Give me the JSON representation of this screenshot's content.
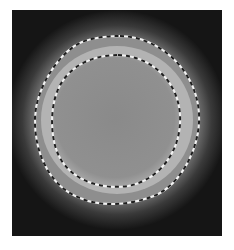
{
  "image": {
    "description": "Grayscale scan showing a bright roughly circular region with two dashed contour overlays",
    "frame": {
      "x": 12,
      "y": 10,
      "width": 210,
      "height": 226
    },
    "colors": {
      "background": "#151515",
      "glow": "#5a5a5a",
      "ring": "#b5b5b5",
      "interior": "#8c8c8c",
      "dash_light": "#f2f2f2",
      "dash_dark": "#1e1e1e"
    },
    "contours": [
      {
        "name": "outer-contour",
        "style": "black/white dashed",
        "path": "M 120 36 C 160 37 196 70 199 113 C 201 150 178 190 148 198 C 128 205 100 207 80 198 C 48 186 34 150 35 118 C 36 85 62 50 82 42 C 95 37 108 36 120 36 Z"
      },
      {
        "name": "inner-contour",
        "style": "black/white dashed",
        "path": "M 118 55 C 150 56 178 80 180 115 C 182 150 160 180 128 186 C 100 190 72 180 60 158 C 50 140 50 110 57 92 C 66 68 90 55 118 55 Z"
      }
    ]
  }
}
